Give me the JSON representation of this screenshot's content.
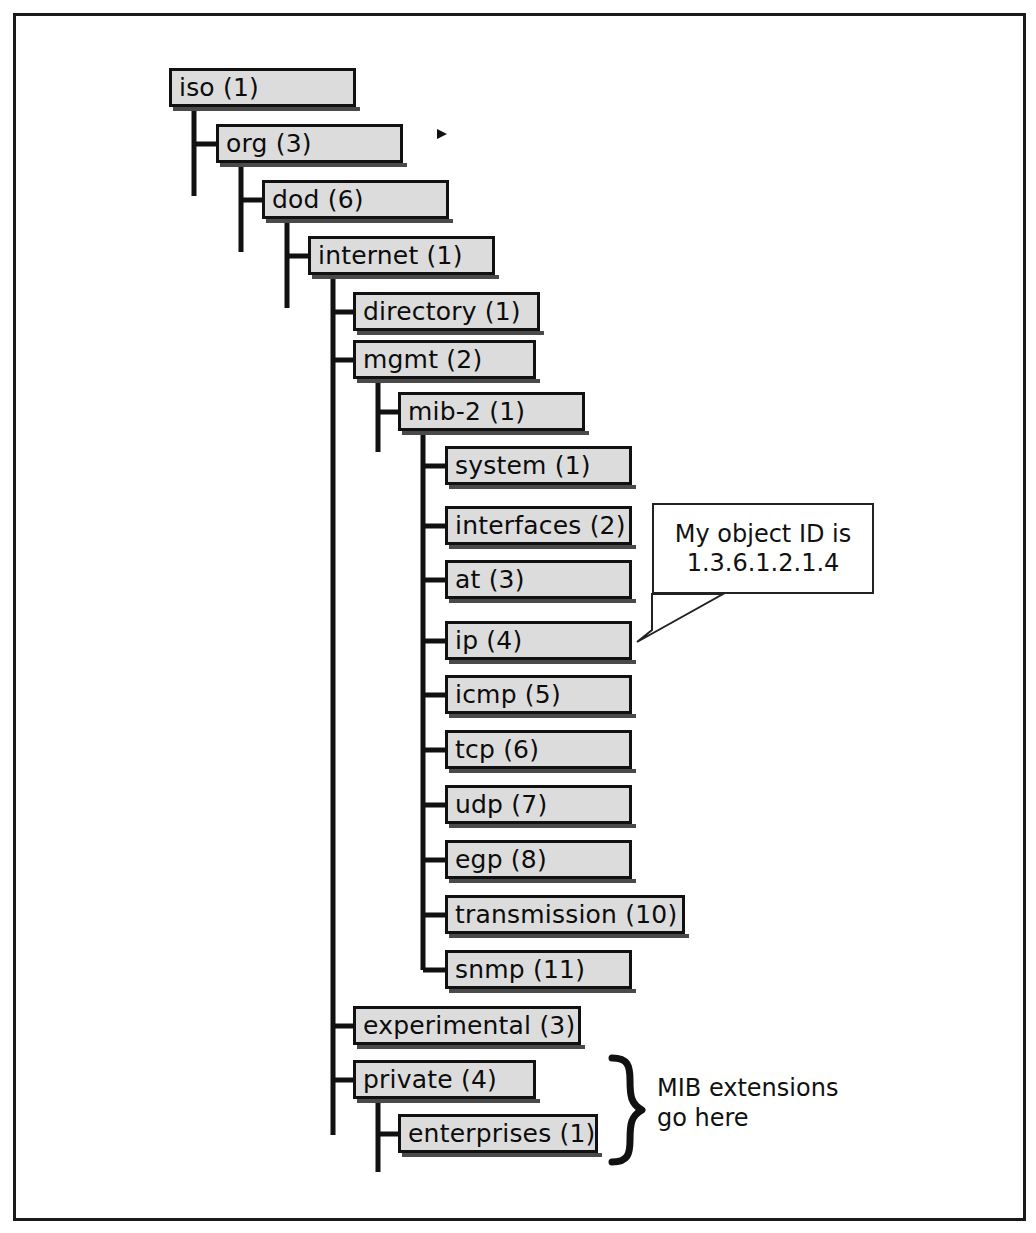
{
  "diagram": {
    "box_fill": "#dcdcdc",
    "box_border": "#111111",
    "frame_border": "#1a1a1a",
    "nodes": [
      {
        "id": "iso",
        "label": "iso (1)",
        "x": 169,
        "y": 68,
        "w": 187,
        "h": 39,
        "depth": 0
      },
      {
        "id": "org",
        "label": "org (3)",
        "x": 216,
        "y": 124,
        "w": 187,
        "h": 39,
        "depth": 1
      },
      {
        "id": "dod",
        "label": "dod (6)",
        "x": 262,
        "y": 180,
        "w": 187,
        "h": 39,
        "depth": 2
      },
      {
        "id": "internet",
        "label": "internet (1)",
        "x": 308,
        "y": 236,
        "w": 187,
        "h": 39,
        "depth": 3
      },
      {
        "id": "directory",
        "label": "directory (1)",
        "x": 353,
        "y": 292,
        "w": 187,
        "h": 39,
        "depth": 4
      },
      {
        "id": "mgmt",
        "label": "mgmt (2)",
        "x": 353,
        "y": 340,
        "w": 183,
        "h": 39,
        "depth": 4
      },
      {
        "id": "mib2",
        "label": "mib-2 (1)",
        "x": 398,
        "y": 392,
        "w": 187,
        "h": 39,
        "depth": 5
      },
      {
        "id": "system",
        "label": "system (1)",
        "x": 445,
        "y": 446,
        "w": 187,
        "h": 39,
        "depth": 6
      },
      {
        "id": "interfaces",
        "label": "interfaces (2)",
        "x": 445,
        "y": 506,
        "w": 187,
        "h": 39,
        "depth": 6
      },
      {
        "id": "at",
        "label": "at (3)",
        "x": 445,
        "y": 560,
        "w": 187,
        "h": 39,
        "depth": 6
      },
      {
        "id": "ip",
        "label": "ip (4)",
        "x": 445,
        "y": 621,
        "w": 187,
        "h": 39,
        "depth": 6
      },
      {
        "id": "icmp",
        "label": "icmp (5)",
        "x": 445,
        "y": 675,
        "w": 187,
        "h": 39,
        "depth": 6
      },
      {
        "id": "tcp",
        "label": "tcp (6)",
        "x": 445,
        "y": 730,
        "w": 187,
        "h": 39,
        "depth": 6
      },
      {
        "id": "udp",
        "label": "udp (7)",
        "x": 445,
        "y": 785,
        "w": 187,
        "h": 39,
        "depth": 6
      },
      {
        "id": "egp",
        "label": "egp (8)",
        "x": 445,
        "y": 840,
        "w": 187,
        "h": 39,
        "depth": 6
      },
      {
        "id": "transmission",
        "label": "transmission (10)",
        "x": 445,
        "y": 895,
        "w": 240,
        "h": 39,
        "depth": 6
      },
      {
        "id": "snmp",
        "label": "snmp (11)",
        "x": 445,
        "y": 950,
        "w": 187,
        "h": 39,
        "depth": 6
      },
      {
        "id": "experimental",
        "label": "experimental (3)",
        "x": 353,
        "y": 1006,
        "w": 228,
        "h": 39,
        "depth": 4
      },
      {
        "id": "private",
        "label": "private (4)",
        "x": 353,
        "y": 1060,
        "w": 183,
        "h": 39,
        "depth": 4
      },
      {
        "id": "enterprises",
        "label": "enterprises (1)",
        "x": 398,
        "y": 1114,
        "w": 200,
        "h": 39,
        "depth": 5
      }
    ],
    "callout": {
      "line1": "My object ID is",
      "line2": "1.3.6.1.2.1.4",
      "points_to": "ip"
    },
    "brace_annotation": {
      "line1": "MIB extensions",
      "line2": "go here",
      "covers": [
        "private (4)",
        "enterprises (1)"
      ]
    }
  },
  "chart_data": {
    "type": "diagram",
    "tree": [
      {
        "label": "iso (1)",
        "oid": "1",
        "children": [
          {
            "label": "org (3)",
            "oid": "1.3",
            "children": [
              {
                "label": "dod (6)",
                "oid": "1.3.6",
                "children": [
                  {
                    "label": "internet (1)",
                    "oid": "1.3.6.1",
                    "children": [
                      {
                        "label": "directory (1)",
                        "oid": "1.3.6.1.1"
                      },
                      {
                        "label": "mgmt (2)",
                        "oid": "1.3.6.1.2",
                        "children": [
                          {
                            "label": "mib-2 (1)",
                            "oid": "1.3.6.1.2.1",
                            "children": [
                              {
                                "label": "system (1)",
                                "oid": "1.3.6.1.2.1.1"
                              },
                              {
                                "label": "interfaces (2)",
                                "oid": "1.3.6.1.2.1.2"
                              },
                              {
                                "label": "at (3)",
                                "oid": "1.3.6.1.2.1.3"
                              },
                              {
                                "label": "ip (4)",
                                "oid": "1.3.6.1.2.1.4"
                              },
                              {
                                "label": "icmp (5)",
                                "oid": "1.3.6.1.2.1.5"
                              },
                              {
                                "label": "tcp (6)",
                                "oid": "1.3.6.1.2.1.6"
                              },
                              {
                                "label": "udp (7)",
                                "oid": "1.3.6.1.2.1.7"
                              },
                              {
                                "label": "egp (8)",
                                "oid": "1.3.6.1.2.1.8"
                              },
                              {
                                "label": "transmission (10)",
                                "oid": "1.3.6.1.2.1.10"
                              },
                              {
                                "label": "snmp (11)",
                                "oid": "1.3.6.1.2.1.11"
                              }
                            ]
                          }
                        ]
                      },
                      {
                        "label": "experimental (3)",
                        "oid": "1.3.6.1.3"
                      },
                      {
                        "label": "private (4)",
                        "oid": "1.3.6.1.4",
                        "children": [
                          {
                            "label": "enterprises (1)",
                            "oid": "1.3.6.1.4.1"
                          }
                        ]
                      }
                    ]
                  }
                ]
              }
            ]
          }
        ]
      }
    ],
    "annotations": [
      {
        "text": "My object ID is 1.3.6.1.2.1.4",
        "target": "ip (4)"
      },
      {
        "text": "MIB extensions go here",
        "target": "private (4) / enterprises (1)"
      }
    ]
  }
}
